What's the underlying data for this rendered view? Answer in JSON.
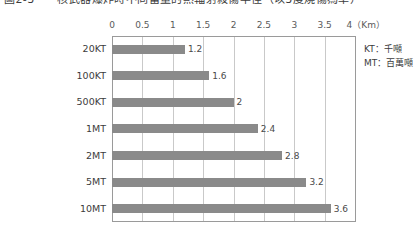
{
  "title": {
    "text": "圖2-3　　核武器爆炸時不同當量的熱輻射殺傷半徑（以3度燒傷為準）",
    "clipped": true
  },
  "legend": {
    "entries": [
      {
        "abbr": "KT",
        "separator": "：",
        "meaning": "千噸",
        "label": "KT：千噸"
      },
      {
        "abbr": "MT",
        "separator": "：",
        "meaning": "百萬噸",
        "label": "MT：百萬噸"
      }
    ]
  },
  "axis": {
    "unit_label": "4（Km）",
    "unit": "Km",
    "tick_labels": [
      "0",
      "0.5",
      "1",
      "1.5",
      "2",
      "2.5",
      "3",
      "3.5",
      "4（Km）"
    ],
    "tick_values": [
      0,
      0.5,
      1,
      1.5,
      2,
      2.5,
      3,
      3.5,
      4
    ]
  },
  "colors": {
    "bar": "#8a8a8a",
    "gridline": "#c9c9c9",
    "axis": "#9a9a9a",
    "text": "#3c3c3c",
    "background": "#ffffff"
  },
  "chart_data": {
    "type": "bar",
    "orientation": "horizontal",
    "title": "圖2-3　　核武器爆炸時不同當量的熱輻射殺傷半徑（以3度燒傷為準）",
    "categories": [
      "20KT",
      "100KT",
      "500KT",
      "1MT",
      "2MT",
      "5MT",
      "10MT"
    ],
    "values": [
      1.2,
      1.6,
      2,
      2.4,
      2.8,
      3.2,
      3.6
    ],
    "value_labels": [
      "1.2",
      "1.6",
      "2",
      "2.4",
      "2.8",
      "3.2",
      "3.6"
    ],
    "xlabel": "Km",
    "ylabel": "",
    "xlim": [
      0,
      4
    ],
    "xticks": [
      0,
      0.5,
      1,
      1.5,
      2,
      2.5,
      3,
      3.5,
      4
    ],
    "xtick_labels": [
      "0",
      "0.5",
      "1",
      "1.5",
      "2",
      "2.5",
      "3",
      "3.5",
      "4（Km）"
    ],
    "grid": true,
    "grid_axis": "x",
    "axis_position": "top",
    "legend": [
      "KT：千噸",
      "MT：百萬噸"
    ],
    "legend_position": "right"
  }
}
